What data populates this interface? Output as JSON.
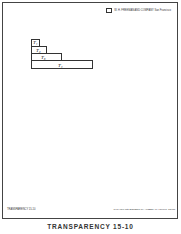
{
  "header": {
    "text": "W. H. FREEMAN AND COMPANY   San Francisco"
  },
  "bars": [
    {
      "label": "T₁"
    },
    {
      "label": "T₂"
    },
    {
      "label": "T₃"
    },
    {
      "label": "T₄"
    }
  ],
  "footer": {
    "left": "TRANSPARENCY 15-10",
    "right": "To be used with ELEMENTARY ALGEBRA by Harold R. Jacobs"
  },
  "caption": "TRANSPARENCY 15-10"
}
